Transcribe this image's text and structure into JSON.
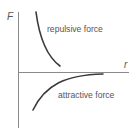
{
  "diagram": {
    "y_axis_label": "F",
    "x_axis_label": "r",
    "curves": [
      {
        "name": "repulsive",
        "label": "repulsive force"
      },
      {
        "name": "attractive",
        "label": "attractive force"
      }
    ],
    "colors": {
      "axis": "#8a8a8a",
      "curve": "#3a3a3a",
      "text": "#555555"
    }
  }
}
